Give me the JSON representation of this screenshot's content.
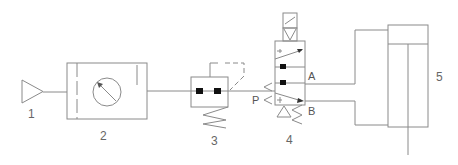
{
  "diagram": {
    "type": "pneumatic-circuit",
    "components": [
      {
        "id": "1",
        "label": "1",
        "symbol": "air-source"
      },
      {
        "id": "2",
        "label": "2",
        "symbol": "filter-regulator-with-gauge"
      },
      {
        "id": "3",
        "label": "3",
        "symbol": "pressure-switch-valve"
      },
      {
        "id": "4",
        "label": "4",
        "symbol": "solenoid-directional-valve"
      },
      {
        "id": "5",
        "label": "5",
        "symbol": "double-acting-cylinder"
      }
    ],
    "ports": {
      "p": "P",
      "a": "A",
      "b": "B"
    },
    "colors": {
      "line": "#8a8a8a",
      "marker": "#111111",
      "text": "#666666"
    }
  }
}
